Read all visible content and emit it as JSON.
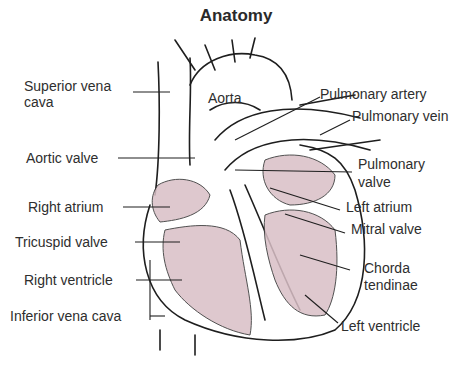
{
  "title": "Anatomy",
  "colors": {
    "tissue": "#d9bfc6",
    "stroke": "#1e1e1e",
    "text": "#2e2e2e"
  },
  "labels": {
    "superior_vena_cava_1": "Superior vena",
    "superior_vena_cava_2": "cava",
    "aortic_valve": "Aortic valve",
    "right_atrium": "Right atrium",
    "tricuspid_valve": "Tricuspid valve",
    "right_ventricle": "Right ventricle",
    "inferior_vena_cava": "Inferior vena cava",
    "aorta": "Aorta",
    "pulmonary_artery": "Pulmonary artery",
    "pulmonary_vein": "Pulmonary vein",
    "pulmonary_valve_1": "Pulmonary",
    "pulmonary_valve_2": "valve",
    "left_atrium": "Left atrium",
    "mitral_valve": "Mitral valve",
    "chorda_tendinae_1": "Chorda",
    "chorda_tendinae_2": "tendinae",
    "left_ventricle": "Left ventricle"
  }
}
